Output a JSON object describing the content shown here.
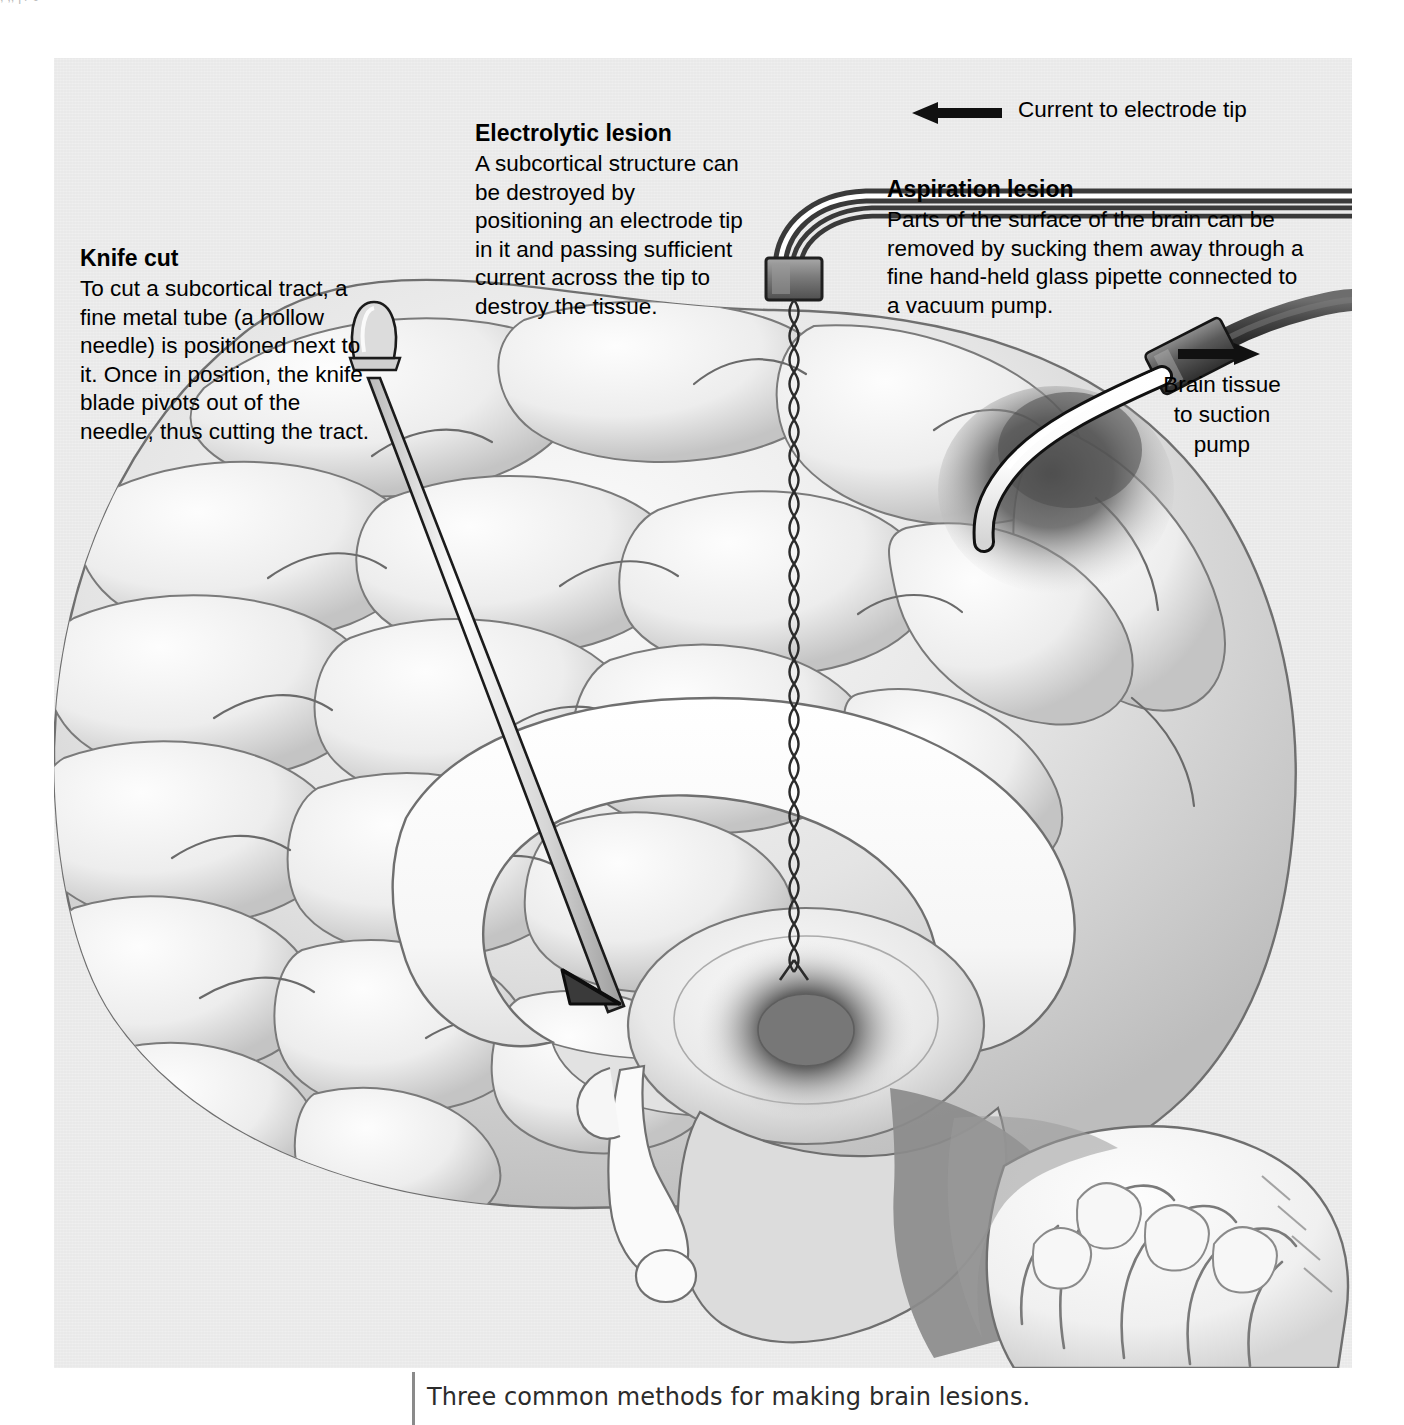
{
  "figure": {
    "caption": "Three common methods for making brain lesions.",
    "top_bleed_text": ",           ,,                                        | /     0"
  },
  "panel": {
    "background_color": "#e9e9e9",
    "callouts": [
      {
        "id": "knife-cut",
        "heading": "Knife cut",
        "body": "To cut a subcortical tract, a fine metal tube (a hollow needle) is positioned next to it. Once in position, the knife blade pivots out of the needle, thus cutting the tract."
      },
      {
        "id": "electrolytic-lesion",
        "heading": "Electrolytic lesion",
        "body": "A subcortical structure can be destroyed by positioning an electrode tip in it and passing sufficient current across the tip to destroy the tissue."
      },
      {
        "id": "aspiration-lesion",
        "heading": "Aspiration lesion",
        "body": "Parts of the surface of the brain can be removed by sucking them away through a fine hand-held glass pipette connected to a vacuum pump."
      }
    ],
    "arrow_labels": [
      {
        "id": "current-to-electrode-tip",
        "text": "Current to electrode tip",
        "direction": "left"
      },
      {
        "id": "brain-tissue-to-suction-pump",
        "text": "Brain tissue\nto suction\npump",
        "direction": "right"
      }
    ]
  },
  "colors": {
    "panel_bg": "#e9e9e9",
    "ink": "#000000",
    "caption_ink": "#2b2b2b",
    "rule": "#8a8a8a",
    "brain_light": "#f2f2f2",
    "brain_mid": "#d2d2d2",
    "brain_dark": "#8d8d8d",
    "brainstem_dark": "#7c7c7c",
    "lesion_dark": "#555555",
    "instrument_metal": "#c9c9c9",
    "instrument_dark": "#4a4a4a"
  }
}
